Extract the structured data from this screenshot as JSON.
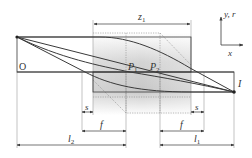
{
  "diagram": {
    "title": "",
    "labels": {
      "origin": "O",
      "z1": "z",
      "z1_sub": "1",
      "P1": "P",
      "P1_sub": "1",
      "P2": "P",
      "P2_sub": "2",
      "axis_y": "y, r",
      "axis_x": "x",
      "I": "I",
      "s_left": "s",
      "s_right": "s",
      "f_left": "f",
      "f_right": "f",
      "l2": "l",
      "l2_sub": "2",
      "l1": "l",
      "l1_sub": "1"
    },
    "colors": {
      "line": "#3a3a3a",
      "guide": "#9a9a9a",
      "shade_dark": "#cfcfcf",
      "shade_light": "#ffffff"
    }
  }
}
